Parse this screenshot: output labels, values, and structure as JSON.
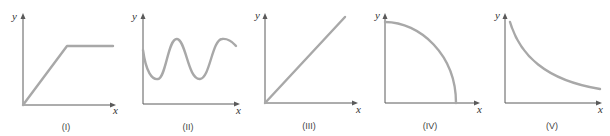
{
  "figure": {
    "axis_color": "#5a5a5a",
    "curve_color": "#a8a8a8",
    "graphs": [
      {
        "caption": "(I)",
        "x_label": "x",
        "y_label": "y",
        "shape": "linear increase from origin then horizontal plateau"
      },
      {
        "caption": "(II)",
        "x_label": "x",
        "y_label": "y",
        "shape": "oscillating sinusoidal wave above x-axis"
      },
      {
        "caption": "(III)",
        "x_label": "x",
        "y_label": "y",
        "shape": "straight line through origin"
      },
      {
        "caption": "(IV)",
        "x_label": "x",
        "y_label": "y",
        "shape": "quarter-circle decreasing from y-intercept to x-intercept"
      },
      {
        "caption": "(V)",
        "x_label": "x",
        "y_label": "y",
        "shape": "decaying curve (inverse / exponential decay)"
      }
    ]
  }
}
